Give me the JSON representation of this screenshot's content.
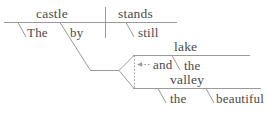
{
  "diagram": {
    "type": "reed-kellogg-sentence-diagram",
    "sentence": "The castle by the lake and the beautiful valley stands still.",
    "colors": {
      "line": "#9a9a9a",
      "text": "#4a4a4a",
      "background": "#ffffff"
    },
    "words": {
      "subject": "castle",
      "subject_article": "The",
      "verb": "stands",
      "adverb": "still",
      "preposition": "by",
      "conjunction": "and",
      "object_upper": "lake",
      "object_upper_article": "the",
      "object_lower": "valley",
      "object_lower_article": "the",
      "object_lower_adjective": "beautiful"
    },
    "labels": {
      "subject": "castle",
      "subject_article": "The",
      "verb": "stands",
      "adverb": "still",
      "preposition": "by",
      "conjunction": "and",
      "object_upper": "lake",
      "object_upper_article": "the",
      "object_lower": "valley",
      "object_lower_article": "the",
      "object_lower_adjective": "beautiful"
    }
  }
}
